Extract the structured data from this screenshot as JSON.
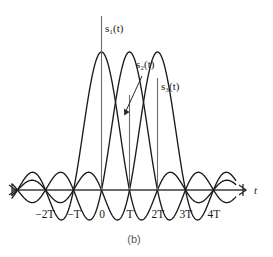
{
  "figure": {
    "caption": "(b)",
    "axis": {
      "x_label": "t",
      "y_label": "",
      "tick_labels": [
        "−2T",
        "−T",
        "0",
        "T",
        "2T",
        "3T",
        "4T"
      ],
      "tick_values": [
        -2,
        -1,
        0,
        1,
        2,
        3,
        4
      ],
      "axis_color": "#3a3a3a",
      "curve_color": "#1a1a1a",
      "stem_color": "#6b6b6b"
    },
    "series_labels": [
      {
        "name": "s1",
        "text": "s₁(t)"
      },
      {
        "name": "s2",
        "text": "s₂(t)"
      },
      {
        "name": "s3",
        "text": "s₃(t)"
      }
    ]
  },
  "chart_data": {
    "type": "line",
    "title": "",
    "subtitle": "",
    "xlabel": "t",
    "ylabel": "",
    "xlim": [
      -3.2,
      4.8
    ],
    "ylim": [
      -0.32,
      1.12
    ],
    "grid": false,
    "legend": "inline-annotations",
    "x_tick_values": [
      -2,
      -1,
      0,
      1,
      2,
      3,
      4
    ],
    "x_tick_labels": [
      "−2T",
      "−T",
      "0",
      "T",
      "2T",
      "3T",
      "4T"
    ],
    "annotations": [
      {
        "text": "s₁(t)",
        "x": 0.15,
        "y": 1.02,
        "points_to": [
          0,
          1
        ]
      },
      {
        "text": "s₂(t)",
        "x": 1.02,
        "y": 0.88,
        "points_to": [
          1,
          1
        ],
        "leader": true
      },
      {
        "text": "s₃(t)",
        "x": 2.1,
        "y": 0.78,
        "points_to": [
          2,
          1
        ]
      }
    ],
    "series": [
      {
        "name": "s1(t)",
        "formula": "sinc((t - 0T)/T)",
        "center": 0,
        "peak_value": 1.0,
        "zeros_at": [
          -3,
          -2,
          -1,
          1,
          2,
          3,
          4
        ],
        "values_at_ticks": [
          0,
          0,
          1,
          0,
          0,
          0,
          0
        ]
      },
      {
        "name": "s2(t)",
        "formula": "sinc((t - 1T)/T)",
        "center": 1,
        "peak_value": 1.0,
        "zeros_at": [
          -2,
          -1,
          0,
          2,
          3,
          4,
          5
        ],
        "values_at_ticks": [
          0,
          0,
          0,
          1,
          0,
          0,
          0
        ]
      },
      {
        "name": "s3(t)",
        "formula": "sinc((t - 2T)/T)",
        "center": 2,
        "peak_value": 1.0,
        "zeros_at": [
          -1,
          0,
          1,
          3,
          4,
          5,
          6
        ],
        "values_at_ticks": [
          0,
          0,
          0,
          0,
          1,
          0,
          0
        ]
      }
    ]
  }
}
